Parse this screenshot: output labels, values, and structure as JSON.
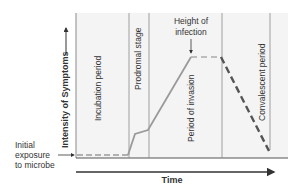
{
  "diagram": {
    "type": "disease-stages",
    "y_axis_label": "Intensity of Symptoms",
    "x_axis_label": "Time",
    "annotations": {
      "peak": [
        "Height of",
        "infection"
      ],
      "exposure": [
        "Initial",
        "exposure",
        "to microbe"
      ]
    },
    "stages": [
      {
        "label": "Incubation period"
      },
      {
        "label": "Prodromal stage"
      },
      {
        "label": "Period of invasion"
      },
      {
        "label": "Convalescent period"
      }
    ],
    "colors": {
      "panel": "#f4f4f4",
      "grid": "#8a8a8a",
      "curve": "#9a9a9a",
      "decline": "#555555",
      "axis": "#333333"
    }
  }
}
